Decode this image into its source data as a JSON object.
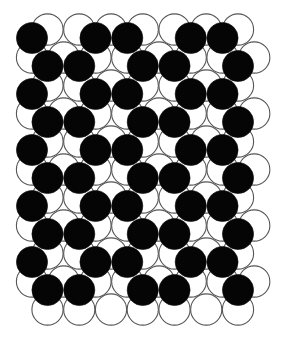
{
  "figure": {
    "colors": {
      "back_layer_fill": "#ffffff",
      "back_layer_stroke": "#555555",
      "front_layer_fill": "#050505",
      "background": "#ffffff"
    },
    "back_layer": {
      "label": "white circles",
      "row_count": 11,
      "rows": [
        "1111111",
        "11111111",
        "1111111",
        "11111111",
        "1111111",
        "11111111",
        "1111111",
        "11111111",
        "1111111",
        "11111111",
        "1111111"
      ]
    },
    "front_layer": {
      "label": "black circles",
      "row_count": 10,
      "rows": [
        "1011011",
        "1101101",
        "1011011",
        "1101101",
        "1011011",
        "1101101",
        "1011011",
        "1101101",
        "1011011",
        "1101101"
      ]
    }
  }
}
